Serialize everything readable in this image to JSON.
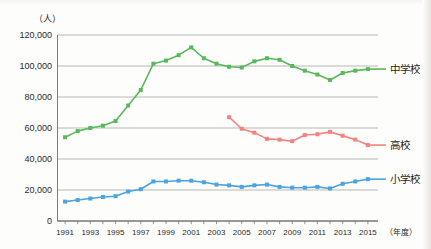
{
  "chart_data": {
    "type": "line",
    "title": "",
    "unit_label": "（人）",
    "xlabel": "（年度）",
    "ylabel": "",
    "x": [
      1991,
      1992,
      1993,
      1994,
      1995,
      1996,
      1997,
      1998,
      1999,
      2000,
      2001,
      2002,
      2003,
      2004,
      2005,
      2006,
      2007,
      2008,
      2009,
      2010,
      2011,
      2012,
      2013,
      2014,
      2015
    ],
    "xlim": [
      1990.4,
      2015.8
    ],
    "ylim": [
      0,
      120000
    ],
    "yticks": [
      0,
      20000,
      40000,
      60000,
      80000,
      100000,
      120000
    ],
    "ytick_labels": [
      "0",
      "20,000",
      "40,000",
      "60,000",
      "80,000",
      "100,000",
      "120,000"
    ],
    "xtick_values": [
      1991,
      1993,
      1995,
      1997,
      1999,
      2001,
      2003,
      2005,
      2007,
      2009,
      2011,
      2013,
      2015
    ],
    "xtick_labels": [
      "1991",
      "1993",
      "1995",
      "1997",
      "1999",
      "2001",
      "2003",
      "2005",
      "2007",
      "2009",
      "2011",
      "2013",
      "2015"
    ],
    "grid": "horizontal",
    "legend_position": "right",
    "series": [
      {
        "name": "中学校",
        "color": "#57b95b",
        "marker": "square",
        "x": [
          1991,
          1992,
          1993,
          1994,
          1995,
          1996,
          1997,
          1998,
          1999,
          2000,
          2001,
          2002,
          2003,
          2004,
          2005,
          2006,
          2007,
          2008,
          2009,
          2010,
          2011,
          2012,
          2013,
          2014,
          2015
        ],
        "values": [
          54000,
          58000,
          60000,
          61500,
          64500,
          74500,
          84500,
          101500,
          103500,
          107000,
          112000,
          105000,
          101500,
          99500,
          99000,
          103000,
          105000,
          104000,
          100000,
          97000,
          94500,
          91000,
          95500,
          97000,
          98000
        ]
      },
      {
        "name": "高校",
        "color": "#f4827f",
        "marker": "square",
        "x": [
          2004,
          2005,
          2006,
          2007,
          2008,
          2009,
          2010,
          2011,
          2012,
          2013,
          2014,
          2015
        ],
        "values": [
          67000,
          59500,
          57000,
          53000,
          52500,
          51500,
          55500,
          56000,
          57500,
          55000,
          52500,
          49000
        ]
      },
      {
        "name": "小学校",
        "color": "#4ba3df",
        "marker": "square",
        "x": [
          1991,
          1992,
          1993,
          1994,
          1995,
          1996,
          1997,
          1998,
          1999,
          2000,
          2001,
          2002,
          2003,
          2004,
          2005,
          2006,
          2007,
          2008,
          2009,
          2010,
          2011,
          2012,
          2013,
          2014,
          2015
        ],
        "values": [
          12500,
          13500,
          14500,
          15500,
          16000,
          19000,
          20500,
          25500,
          25500,
          26000,
          26000,
          25000,
          23500,
          23000,
          22000,
          23000,
          23500,
          22000,
          21500,
          21500,
          22000,
          21000,
          24000,
          25500,
          27000
        ]
      }
    ],
    "legend": [
      {
        "label": "中学校",
        "color": "#57b95b"
      },
      {
        "label": "高校",
        "color": "#f4827f"
      },
      {
        "label": "小学校",
        "color": "#4ba3df"
      }
    ]
  }
}
